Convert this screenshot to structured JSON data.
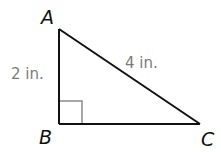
{
  "diagram": {
    "type": "right-triangle",
    "vertices": {
      "A": {
        "label": "A",
        "x": 59,
        "y": 29
      },
      "B": {
        "label": "B",
        "x": 59,
        "y": 124
      },
      "C": {
        "label": "C",
        "x": 200,
        "y": 124
      }
    },
    "sides": {
      "AB": {
        "label": "2 in."
      },
      "AC": {
        "label": "4 in."
      }
    },
    "right_angle_at": "B",
    "colors": {
      "line": "#111111",
      "side_label": "#7a7a7a",
      "right_angle_marker": "#8a8a8a"
    }
  }
}
